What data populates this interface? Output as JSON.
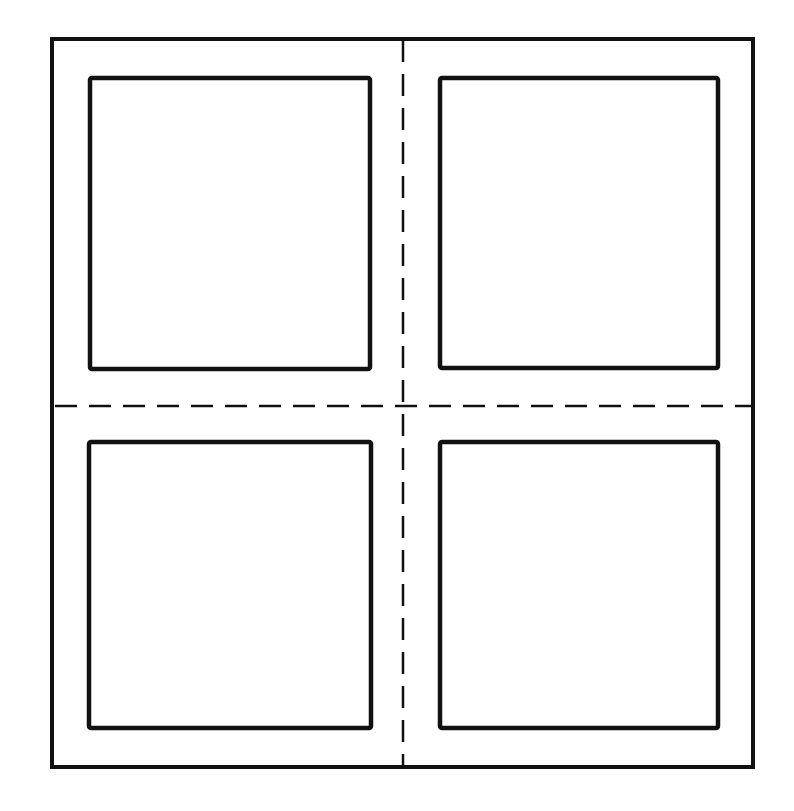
{
  "diagram": {
    "type": "window-pane-layout",
    "stroke_color": "#111111",
    "background": "#ffffff",
    "outer_frame": {
      "x": 52,
      "y": 39,
      "width": 701,
      "height": 728
    },
    "panes": [
      {
        "name": "top-left",
        "x": 90,
        "y": 78,
        "width": 280,
        "height": 291
      },
      {
        "name": "top-right",
        "x": 440,
        "y": 78,
        "width": 278,
        "height": 290
      },
      {
        "name": "bottom-left",
        "x": 89,
        "y": 442,
        "width": 282,
        "height": 286
      },
      {
        "name": "bottom-right",
        "x": 440,
        "y": 442,
        "width": 278,
        "height": 286
      }
    ],
    "guides": {
      "vertical": {
        "x": 403,
        "y1": 40,
        "y2": 766
      },
      "horizontal": {
        "y": 406,
        "x1": 55,
        "x2": 752
      }
    }
  }
}
